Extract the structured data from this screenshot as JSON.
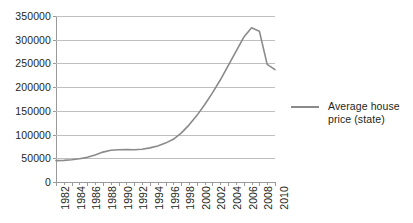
{
  "chart_data": {
    "type": "line",
    "title": "",
    "xlabel": "",
    "ylabel": "",
    "grid": true,
    "legend_position": "right",
    "xlim": [
      1982,
      2010
    ],
    "ylim": [
      0,
      350000
    ],
    "y_ticks": [
      0,
      50000,
      100000,
      150000,
      200000,
      250000,
      300000,
      350000
    ],
    "y_tick_labels": [
      "0",
      "50000",
      "100000",
      "150000",
      "200000",
      "250000",
      "300000",
      "350000"
    ],
    "x_tick_labels": [
      "1982",
      "1984",
      "1986",
      "1988",
      "1990",
      "1992",
      "1994",
      "1996",
      "1998",
      "2000",
      "2002",
      "2004",
      "2006",
      "2008",
      "2010"
    ],
    "x_minor_step": 1,
    "x": [
      1982,
      1983,
      1984,
      1985,
      1986,
      1987,
      1988,
      1989,
      1990,
      1991,
      1992,
      1993,
      1994,
      1995,
      1996,
      1997,
      1998,
      1999,
      2000,
      2001,
      2002,
      2003,
      2004,
      2005,
      2006,
      2007,
      2008,
      2009,
      2010
    ],
    "series": [
      {
        "name": "Average house price (state)",
        "color": "#8a8a8a",
        "values": [
          45000,
          45500,
          47000,
          49000,
          52000,
          57000,
          63000,
          67000,
          68000,
          68500,
          68000,
          69000,
          72000,
          76000,
          82000,
          90000,
          103000,
          120000,
          140000,
          163000,
          188000,
          215000,
          245000,
          275000,
          305000,
          325000,
          318000,
          248000,
          237000
        ]
      }
    ]
  },
  "legend": {
    "entries": [
      {
        "label": "Average house price (state)",
        "color": "#8a8a8a"
      }
    ],
    "label_line1": "Average house",
    "label_line2": "price (state)"
  }
}
